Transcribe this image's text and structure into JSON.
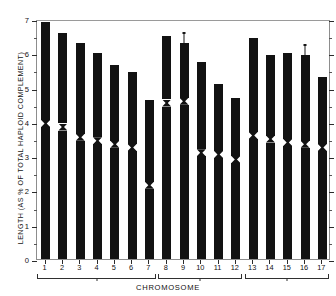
{
  "chart_data": {
    "type": "bar",
    "title": "",
    "xlabel": "CHROMOSOME",
    "ylabel": "LENGTH (AS % OF TOTAL HAPLOID COMPLEMENT)",
    "categories": [
      "1",
      "2",
      "3",
      "4",
      "5",
      "6",
      "7",
      "8",
      "9",
      "10",
      "11",
      "12",
      "13",
      "14",
      "15",
      "16",
      "17"
    ],
    "values": [
      6.9,
      6.6,
      6.3,
      6.0,
      5.65,
      5.45,
      4.65,
      6.5,
      6.3,
      5.75,
      5.1,
      4.7,
      6.45,
      5.95,
      6.0,
      5.95,
      5.3
    ],
    "ylim": [
      0,
      7
    ],
    "yticks": [
      0,
      1,
      2,
      3,
      4,
      5,
      6,
      7
    ],
    "ytick_labels": [
      "0",
      "1",
      "2",
      "3",
      "4",
      "5",
      "6",
      "7"
    ],
    "grid": false,
    "legend": null,
    "centromere_positions": [
      3.95,
      3.85,
      3.55,
      3.45,
      3.35,
      3.25,
      2.15,
      4.55,
      4.6,
      3.1,
      3.05,
      2.9,
      3.6,
      3.5,
      3.4,
      3.35,
      3.25
    ],
    "satellites": [
      "9",
      "16"
    ],
    "groups": [
      {
        "label": "",
        "from": "1",
        "to": "7"
      },
      {
        "label": "",
        "from": "8",
        "to": "12"
      },
      {
        "label": "",
        "from": "13",
        "to": "17"
      }
    ]
  }
}
